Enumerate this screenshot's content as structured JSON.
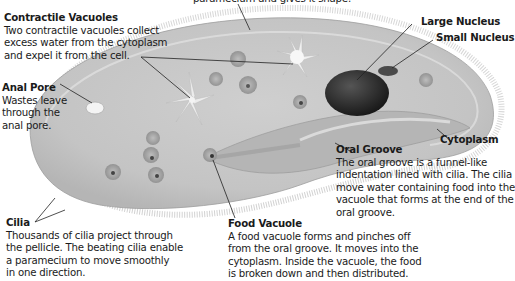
{
  "diagram": {
    "subject": "Paramecium",
    "top_caption": "paramecium and gives it shape.",
    "labels": {
      "contractile_vacuoles": {
        "title": "Contractile Vacuoles",
        "lines": [
          "Two contractile vacuoles collect",
          "excess water from the cytoplasm",
          "and expel it from the cell."
        ]
      },
      "anal_pore": {
        "title": "Anal Pore",
        "lines": [
          "Wastes leave",
          "through the",
          "anal pore."
        ]
      },
      "cilia": {
        "title": "Cilia",
        "lines": [
          "Thousands of cilia project through",
          "the pellicle. The beating cilia enable",
          "a paramecium to move smoothly",
          "in one direction."
        ]
      },
      "food_vacuole": {
        "title": "Food Vacuole",
        "lines": [
          "A food vacuole forms and pinches off",
          "from the oral groove. It moves into the",
          "cytoplasm. Inside the vacuole, the food",
          "is broken down and then distributed."
        ]
      },
      "oral_groove": {
        "title": "Oral Groove",
        "lines": [
          "The oral groove is a funnel-like",
          "indentation lined with cilia. The cilia",
          "move water containing food into the",
          "vacuole that forms at the end of the",
          "oral groove."
        ]
      },
      "large_nucleus": {
        "title": "Large Nucleus"
      },
      "small_nucleus": {
        "title": "Small Nucleus"
      },
      "cytoplasm": {
        "title": "Cytoplasm"
      }
    },
    "colors": {
      "body_fill": "#c9c9c9",
      "body_rim": "#e6e6e6",
      "cilia": "#9a9a9a",
      "nucleus": "#2e2e2e",
      "vacuole": "#a8a8a8",
      "text": "#1a1a1a",
      "leader": "#222222"
    }
  }
}
